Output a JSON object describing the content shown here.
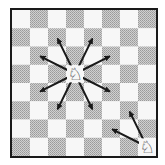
{
  "diagram": {
    "type": "chessboard",
    "orientation": "white-bottom",
    "files": [
      "a",
      "b",
      "c",
      "d",
      "e",
      "f",
      "g",
      "h"
    ],
    "ranks": [
      8,
      7,
      6,
      5,
      4,
      3,
      2,
      1
    ],
    "colors": {
      "light_square": "#f7f7f7",
      "dark_square": "#b5b5b5",
      "border": "#1a1a1a",
      "arrow": "#1a1a1a"
    },
    "pieces": [
      {
        "id": "knight-center",
        "type": "knight",
        "color": "white",
        "square": "d5",
        "glyph": "♘"
      },
      {
        "id": "knight-corner",
        "type": "knight",
        "color": "white",
        "square": "h1",
        "glyph": "♘"
      }
    ],
    "moves": [
      {
        "from": "d5",
        "to": "b6"
      },
      {
        "from": "d5",
        "to": "c7"
      },
      {
        "from": "d5",
        "to": "e7"
      },
      {
        "from": "d5",
        "to": "f6"
      },
      {
        "from": "d5",
        "to": "f4"
      },
      {
        "from": "d5",
        "to": "e3"
      },
      {
        "from": "d5",
        "to": "c3"
      },
      {
        "from": "d5",
        "to": "b4"
      },
      {
        "from": "h1",
        "to": "g3"
      },
      {
        "from": "h1",
        "to": "f2"
      }
    ]
  }
}
